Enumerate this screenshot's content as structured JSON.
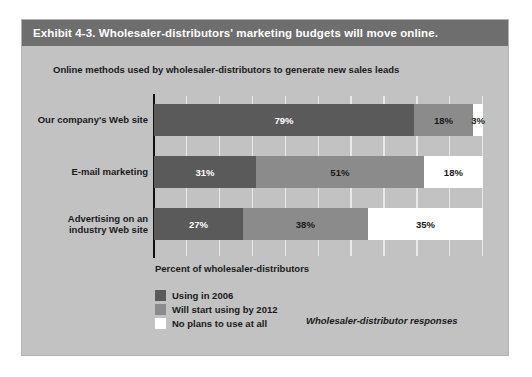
{
  "exhibit": {
    "title": "Exhibit 4-3. Wholesaler-distributors' marketing budgets will move online.",
    "subtitle": "Online methods used by wholesaler-distributors to generate new sales leads",
    "axis_caption": "Percent of wholesaler-distributors",
    "source_note": "Wholesaler-distributor responses"
  },
  "colors": {
    "panel_background": "#c2c2c2",
    "title_bar": "#6e6e6e",
    "title_text": "#ffffff",
    "series_using_2006": "#5a5a5a",
    "series_will_start_2012": "#8b8b8b",
    "series_no_plans": "#ffffff",
    "axis_line": "#111111",
    "gridline": "#e9e9e9"
  },
  "chart_data": {
    "type": "bar",
    "orientation": "horizontal",
    "stacked": true,
    "title": "Online methods used by wholesaler-distributors to generate new sales leads",
    "subtitle": "",
    "xlabel": "Percent of wholesaler-distributors",
    "ylabel": "",
    "xlim": [
      0,
      100
    ],
    "xticks": [
      0,
      10,
      20,
      30,
      40,
      50,
      60,
      70,
      80,
      90,
      100
    ],
    "grid": true,
    "grid_axis": "x",
    "legend_position": "bottom-left",
    "categories": [
      "Our company's Web site",
      "E-mail marketing",
      "Advertising on an industry Web site"
    ],
    "category_label_lines": [
      [
        "Our company's Web site"
      ],
      [
        "E-mail marketing"
      ],
      [
        "Advertising on an",
        "industry Web site"
      ]
    ],
    "series": [
      {
        "name": "Using in 2006",
        "color": "#5a5a5a",
        "values": [
          79,
          31,
          27
        ],
        "labels": [
          "79%",
          "31%",
          "27%"
        ]
      },
      {
        "name": "Will start using by 2012",
        "color": "#8b8b8b",
        "values": [
          18,
          51,
          38
        ],
        "labels": [
          "18%",
          "51%",
          "38%"
        ]
      },
      {
        "name": "No plans to use at all",
        "color": "#ffffff",
        "values": [
          3,
          18,
          35
        ],
        "labels": [
          "3%",
          "18%",
          "35%"
        ]
      }
    ]
  },
  "legend": {
    "items": [
      {
        "label": "Using in 2006",
        "color": "#5a5a5a"
      },
      {
        "label": "Will start using by 2012",
        "color": "#8b8b8b"
      },
      {
        "label": "No plans to use at all",
        "color": "#ffffff"
      }
    ]
  }
}
